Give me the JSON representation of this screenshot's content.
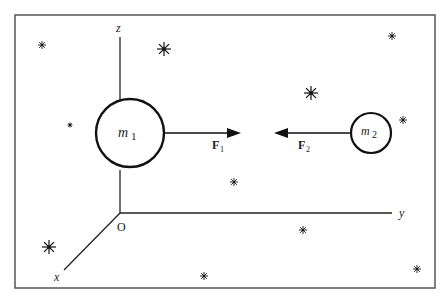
{
  "diagram": {
    "type": "physics-gravitational-forces",
    "axes": {
      "z_label": "z",
      "y_label": "y",
      "x_label": "x",
      "origin_label": "O"
    },
    "masses": [
      {
        "label": "m",
        "subscript": "1"
      },
      {
        "label": "m",
        "subscript": "2"
      }
    ],
    "forces": [
      {
        "label": "F",
        "subscript": "1",
        "direction": "right"
      },
      {
        "label": "F",
        "subscript": "2",
        "direction": "left"
      }
    ],
    "stars": [
      {
        "x": 42,
        "y": 45,
        "size": "small"
      },
      {
        "x": 164,
        "y": 49,
        "size": "large"
      },
      {
        "x": 70,
        "y": 125,
        "size": "tiny"
      },
      {
        "x": 392,
        "y": 36,
        "size": "small"
      },
      {
        "x": 311,
        "y": 93,
        "size": "large"
      },
      {
        "x": 403,
        "y": 120,
        "size": "small"
      },
      {
        "x": 234,
        "y": 182,
        "size": "small"
      },
      {
        "x": 303,
        "y": 230,
        "size": "small"
      },
      {
        "x": 49,
        "y": 247,
        "size": "large"
      },
      {
        "x": 204,
        "y": 276,
        "size": "small"
      },
      {
        "x": 417,
        "y": 269,
        "size": "small"
      }
    ],
    "colors": {
      "ink": "#111111",
      "frame": "#555555",
      "background": "#ffffff"
    }
  }
}
